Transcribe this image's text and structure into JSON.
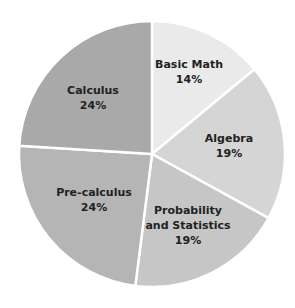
{
  "chart_data": {
    "type": "pie",
    "title": "",
    "categories": [
      "Basic Math",
      "Algebra",
      "Probability and Statistics",
      "Pre-calculus",
      "Calculus"
    ],
    "values": [
      14,
      19,
      19,
      24,
      24
    ],
    "unit": "%",
    "start_angle_deg": 0,
    "direction": "clockwise",
    "colors": [
      "#eaeaea",
      "#d5d5d5",
      "#c6c6c6",
      "#b5b5b5",
      "#a9a9a9"
    ],
    "slice_separator_color": "#ffffff",
    "legend": "none (labels inside slices)"
  },
  "slices": [
    {
      "name": "Basic Math",
      "lines": [
        "Basic Math"
      ],
      "pct": "14%",
      "color": "#eaeaea",
      "lx": 189,
      "ly": 68
    },
    {
      "name": "Algebra",
      "lines": [
        "Algebra"
      ],
      "pct": "19%",
      "color": "#d5d5d5",
      "lx": 229,
      "ly": 142
    },
    {
      "name": "Probability and Statistics",
      "lines": [
        "Probability",
        "and Statistics"
      ],
      "pct": "19%",
      "color": "#c6c6c6",
      "lx": 188,
      "ly": 214
    },
    {
      "name": "Pre-calculus",
      "lines": [
        "Pre-calculus"
      ],
      "pct": "24%",
      "color": "#b5b5b5",
      "lx": 94,
      "ly": 196
    },
    {
      "name": "Calculus",
      "lines": [
        "Calculus"
      ],
      "pct": "24%",
      "color": "#a9a9a9",
      "lx": 93,
      "ly": 94
    }
  ],
  "geometry": {
    "cx": 152,
    "cy": 154,
    "r": 133
  }
}
